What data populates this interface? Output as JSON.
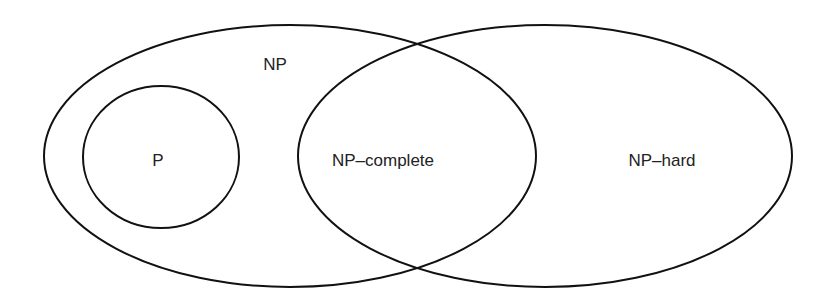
{
  "diagram": {
    "type": "venn",
    "title": "",
    "stroke_color": "#111111",
    "text_color": "#222222",
    "background": "#ffffff",
    "sets": [
      {
        "id": "np",
        "label": "NP"
      },
      {
        "id": "p",
        "label": "P"
      },
      {
        "id": "np_complete",
        "label": "NP–complete"
      },
      {
        "id": "np_hard",
        "label": "NP–hard"
      }
    ],
    "relations": [
      "P is contained in NP",
      "NP–complete is the intersection of NP and NP–hard"
    ]
  }
}
